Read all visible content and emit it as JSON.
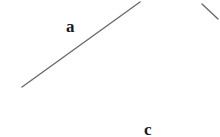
{
  "figure": {
    "background_color": "#ffffff",
    "stroke_color": "#6a6a6a",
    "label_color": "#1a1a1a",
    "width": 220,
    "height": 137,
    "labels": {
      "segment_a": "a",
      "segment_c": "c"
    },
    "segments": [
      {
        "name": "segment-a-line",
        "x1": 22,
        "y1": 87,
        "x2": 140,
        "y2": 2,
        "stroke_width": 1.4
      },
      {
        "name": "segment-corner-line",
        "x1": 202,
        "y1": 4,
        "x2": 218,
        "y2": 19,
        "stroke_width": 1.4
      }
    ]
  }
}
